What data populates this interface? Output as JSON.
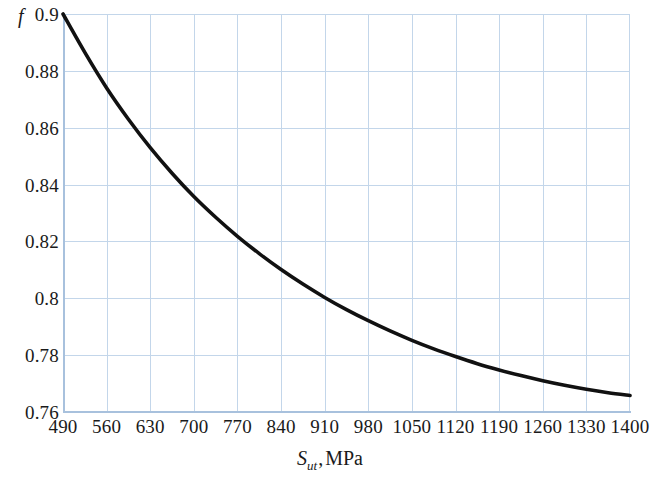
{
  "figure": {
    "background_color": "#ffffff",
    "grid_color": "#c3d6ea",
    "axis_color": "#a8c1dd",
    "curve_color": "#111111"
  },
  "axes": {
    "y_symbol": "f",
    "x_symbol": "S",
    "x_subscript": "ut",
    "x_separator": ",",
    "x_unit": "MPa",
    "y_tick_labels": [
      "0.9",
      "0.88",
      "0.86",
      "0.84",
      "0.82",
      "0.8",
      "0.78",
      "0.76"
    ],
    "x_tick_labels": [
      "490",
      "560",
      "630",
      "700",
      "770",
      "840",
      "910",
      "980",
      "1050",
      "1120",
      "1190",
      "1260",
      "1330",
      "1400"
    ]
  },
  "chart_data": {
    "type": "line",
    "title": "",
    "xlabel": "S_ut , MPa",
    "ylabel": "f",
    "xlim": [
      490,
      1400
    ],
    "ylim": [
      0.76,
      0.9
    ],
    "xticks": [
      490,
      560,
      630,
      700,
      770,
      840,
      910,
      980,
      1050,
      1120,
      1190,
      1260,
      1330,
      1400
    ],
    "yticks": [
      0.76,
      0.78,
      0.8,
      0.82,
      0.84,
      0.86,
      0.88,
      0.9
    ],
    "grid": true,
    "legend": "none",
    "series": [
      {
        "name": "f",
        "x": [
          490,
          525,
          560,
          595,
          630,
          665,
          700,
          735,
          770,
          805,
          840,
          875,
          910,
          945,
          980,
          1015,
          1050,
          1085,
          1120,
          1155,
          1190,
          1225,
          1260,
          1295,
          1330,
          1365,
          1400
        ],
        "y": [
          0.9,
          0.8865,
          0.874,
          0.863,
          0.853,
          0.844,
          0.8358,
          0.8285,
          0.8218,
          0.8157,
          0.8101,
          0.805,
          0.8003,
          0.796,
          0.7921,
          0.7885,
          0.7852,
          0.7822,
          0.7795,
          0.777,
          0.7748,
          0.7728,
          0.771,
          0.7694,
          0.768,
          0.7668,
          0.7658
        ]
      }
    ]
  }
}
